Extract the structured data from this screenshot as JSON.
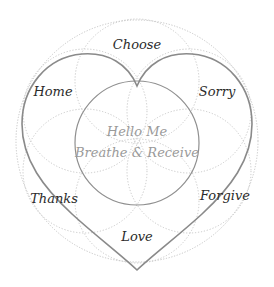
{
  "diagram": {
    "type": "flower-of-life heart diagram",
    "center": {
      "line1": "Hello Me",
      "line2": "Breathe & Receive"
    },
    "labels": {
      "top": "Choose",
      "upper_left": "Home",
      "upper_right": "Sorry",
      "lower_left": "Thanks",
      "lower_right": "Forgive",
      "bottom": "Love"
    },
    "colors": {
      "heart_stroke": "#8a8a8a",
      "inner_circle_stroke": "#8f8f8f",
      "dotted_stroke": "#bdbdbd",
      "label_text": "#2b2b2b",
      "center_text": "#9a9a9a",
      "background": "#ffffff"
    }
  }
}
